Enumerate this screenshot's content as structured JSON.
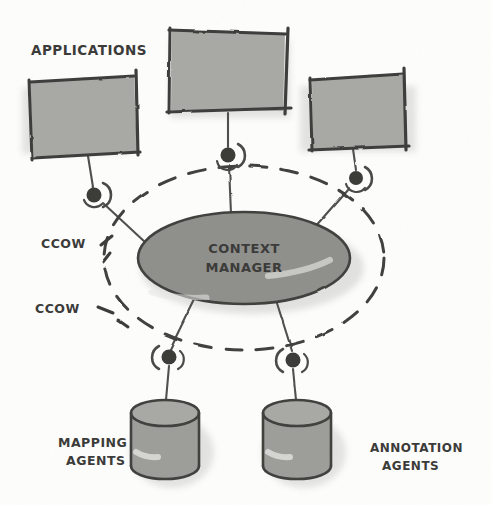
{
  "diagram": {
    "style": "hand-drawn-sketch",
    "background_color": "#fdfdfc",
    "ink_color": "#4a4a48",
    "shape_fill_gray": "#a3a3a1",
    "ellipse_fill_gray": "#8e8e8c",
    "shadow_color": "#c9c9c6"
  },
  "labels": {
    "applications": "APPLICATIONS",
    "ccow_upper": "CCOW",
    "ccow_lower": "CCOW",
    "mapping_agents_line1": "MAPPING",
    "mapping_agents_line2": "AGENTS",
    "annotation_agents_line1": "ANNOTATION",
    "annotation_agents_line2": "AGENTS"
  },
  "context_manager": {
    "line1": "CONTEXT",
    "line2": "MANAGER"
  },
  "nodes": {
    "applications": [
      {
        "id": "app-left",
        "name": "application-box-left",
        "cx": 82,
        "cy": 118
      },
      {
        "id": "app-center",
        "name": "application-box-center",
        "cx": 227,
        "cy": 72
      },
      {
        "id": "app-right",
        "name": "application-box-right",
        "cx": 358,
        "cy": 114
      }
    ],
    "agents": [
      {
        "id": "mapping-agent",
        "name": "mapping-agent-cylinder",
        "cx": 165,
        "cy": 440
      },
      {
        "id": "annotation-agent",
        "name": "annotation-agent-cylinder",
        "cx": 297,
        "cy": 440
      }
    ],
    "connectors": [
      {
        "id": "conn-app-left",
        "name": "ccow-connector-app-left",
        "cx": 94,
        "cy": 195
      },
      {
        "id": "conn-app-center",
        "name": "ccow-connector-app-center",
        "cx": 228,
        "cy": 155
      },
      {
        "id": "conn-app-right",
        "name": "ccow-connector-app-right",
        "cx": 356,
        "cy": 178
      },
      {
        "id": "conn-map",
        "name": "ccow-connector-mapping",
        "cx": 169,
        "cy": 357
      },
      {
        "id": "conn-ann",
        "name": "ccow-connector-annotation",
        "cx": 293,
        "cy": 360
      }
    ]
  },
  "boundary": {
    "name": "ccow-context-boundary",
    "stroke_style": "dashed",
    "cx": 244,
    "cy": 258,
    "rx": 140,
    "ry": 92
  }
}
